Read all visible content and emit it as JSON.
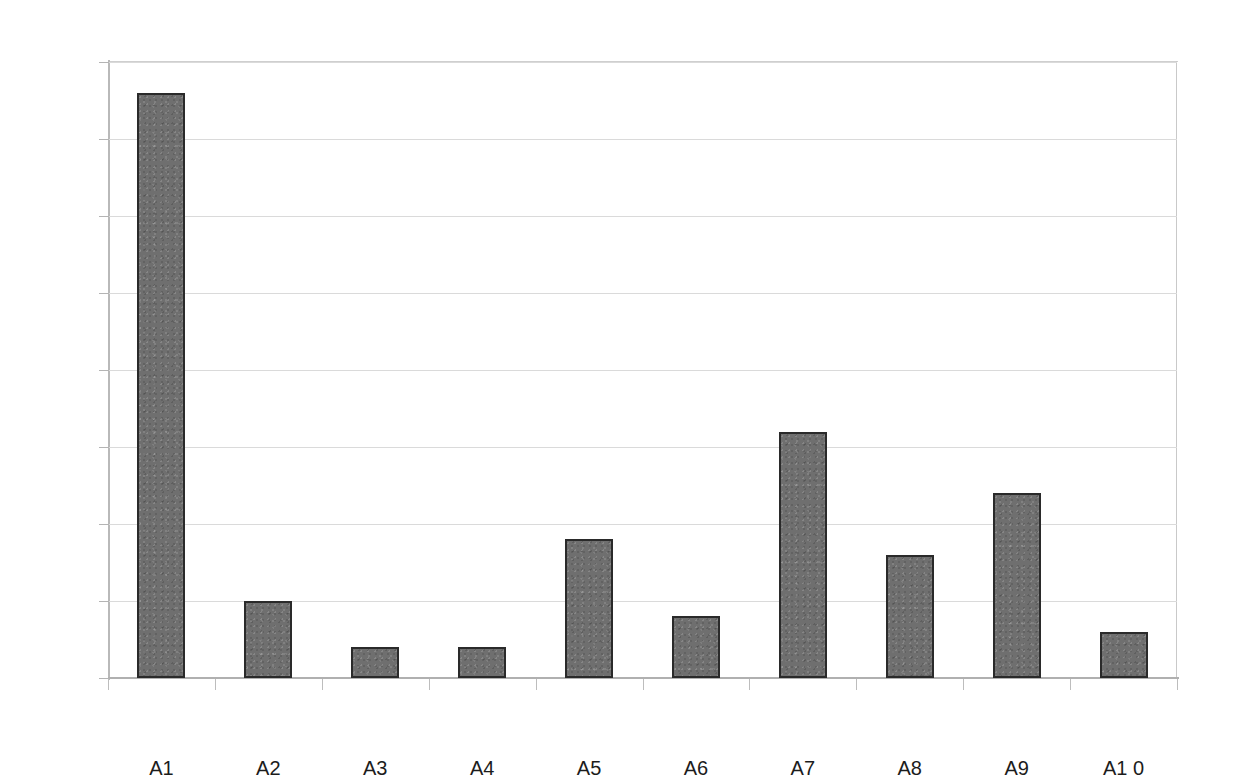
{
  "chart_data": {
    "type": "bar",
    "title": "",
    "subtitle": "",
    "xlabel": "",
    "ylabel": "",
    "categories": [
      "A1",
      "A2",
      "A3",
      "A4",
      "A5",
      "A6",
      "A7",
      "A8",
      "A9",
      "A1 0"
    ],
    "values": [
      38,
      5,
      2,
      2,
      9,
      4,
      16,
      8,
      12,
      3
    ],
    "ylim": [
      0,
      40
    ],
    "ytick_labels": [
      "0",
      "5",
      "10",
      "15",
      "20",
      "25",
      "30",
      "35",
      "40"
    ],
    "ytick_values": [
      0,
      5,
      10,
      15,
      20,
      25,
      30,
      35,
      40
    ],
    "grid": "horizontal",
    "legend": null,
    "legend_position": "none",
    "annotations": [],
    "series": [
      {
        "name": "",
        "values": [
          38,
          5,
          2,
          2,
          9,
          4,
          16,
          8,
          12,
          3
        ]
      }
    ],
    "style": {
      "bar_fill": "#6f6f6f",
      "bar_border": "#2a2a2a",
      "gridline_color": "#dadada",
      "axis_color": "#b4b4b4",
      "text_color": "#1c1c1c",
      "background": "#ffffff"
    }
  }
}
